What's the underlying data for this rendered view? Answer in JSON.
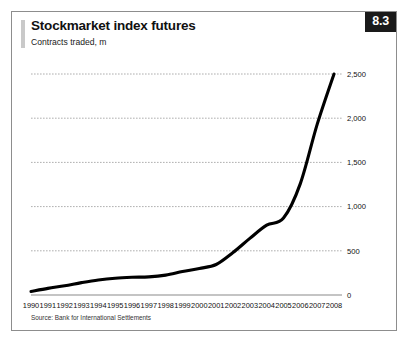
{
  "card": {
    "title": "Stockmarket index futures",
    "subtitle": "Contracts traded, m",
    "badge": "8.3",
    "source": "Source: Bank for International Settlements",
    "accent_color": "#c9c9c9",
    "badge_bg": "#1a1a1a",
    "badge_fg": "#ffffff",
    "line_color": "#000000",
    "grid_color": "#9a9a9a",
    "border_color": "#8d8d8d"
  },
  "chart_data": {
    "type": "line",
    "title": "Stockmarket index futures",
    "subtitle": "Contracts traded, m",
    "xlabel": "",
    "ylabel": "Contracts traded, m",
    "ylim": [
      0,
      2500
    ],
    "yticks": [
      0,
      500,
      1000,
      1500,
      2000,
      2500
    ],
    "ytick_labels": [
      "0",
      "500",
      "1,000",
      "1,500",
      "2,000",
      "2,500"
    ],
    "y_axis_position": "right",
    "grid": true,
    "grid_style": "dotted-horizontal",
    "legend": "none",
    "categories": [
      1990,
      1991,
      1992,
      1993,
      1994,
      1995,
      1996,
      1997,
      1998,
      1999,
      2000,
      2001,
      2002,
      2003,
      2004,
      2005,
      2006,
      2007,
      2008
    ],
    "xtick_labels": [
      "1990",
      "1991",
      "1992",
      "1993",
      "1994",
      "1995",
      "1996",
      "1997",
      "1998",
      "1999",
      "2000",
      "2001",
      "2002",
      "2003",
      "2004",
      "2005",
      "2006",
      "2007",
      "2008"
    ],
    "series": [
      {
        "name": "Contracts traded",
        "values": [
          40,
          75,
          105,
          140,
          170,
          190,
          200,
          205,
          225,
          265,
          300,
          345,
          480,
          640,
          790,
          870,
          1260,
          1930,
          2500
        ]
      }
    ]
  }
}
